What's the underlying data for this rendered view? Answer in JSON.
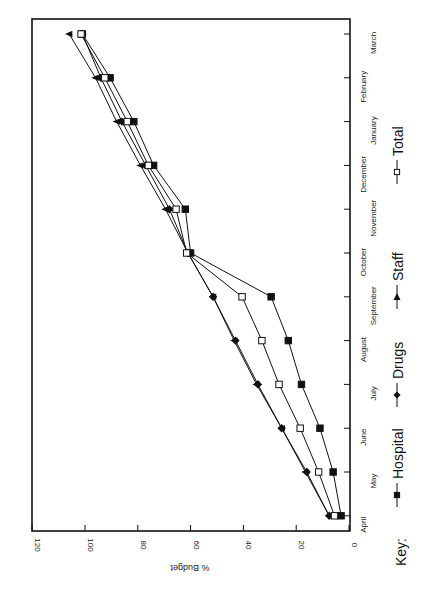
{
  "chart_data": {
    "type": "line",
    "orientation": "rotated-90-clockwise",
    "title": "",
    "xlabel": "",
    "ylabel": "% Budget",
    "ylim": [
      0,
      120
    ],
    "yticks": [
      0,
      20,
      40,
      60,
      80,
      100,
      120
    ],
    "categories": [
      "April",
      "May",
      "June",
      "July",
      "August",
      "September",
      "October",
      "November",
      "December",
      "January",
      "February",
      "March"
    ],
    "series": [
      {
        "name": "Hospital",
        "marker": "filled-square",
        "values": [
          3,
          6,
          11,
          18,
          23,
          29.5,
          60,
          62,
          74,
          81.5,
          90.5,
          101
        ]
      },
      {
        "name": "Drugs",
        "marker": "filled-diamond",
        "values": [
          7.5,
          16,
          25.5,
          34.5,
          43,
          51.5,
          61,
          68,
          77,
          86,
          94,
          101
        ]
      },
      {
        "name": "Staff",
        "marker": "filled-triangle",
        "values": [
          7.5,
          16.5,
          25.5,
          35,
          43.5,
          51.5,
          61,
          69.5,
          79,
          88,
          96,
          106
        ]
      },
      {
        "name": "Total",
        "marker": "open-square",
        "values": [
          5.5,
          11.5,
          18.5,
          26.5,
          33,
          40.5,
          61.5,
          65.5,
          76,
          84,
          92.5,
          101.5
        ]
      }
    ],
    "grid": false,
    "legend_position": "bottom (rotated: right side)"
  },
  "legend": {
    "key_label": "Key:",
    "items": [
      {
        "label": "Hospital",
        "icon": "filled-square-icon"
      },
      {
        "label": "Drugs",
        "icon": "filled-diamond-icon"
      },
      {
        "label": "Staff",
        "icon": "filled-triangle-icon"
      },
      {
        "label": "Total",
        "icon": "open-square-icon"
      }
    ]
  },
  "axis": {
    "value_title": "% Budget",
    "value_ticks": [
      "0",
      "20",
      "40",
      "60",
      "80",
      "100",
      "120"
    ],
    "month_ticks": [
      "April",
      "May",
      "June",
      "July",
      "August",
      "September",
      "October",
      "November",
      "December",
      "January",
      "February",
      "March"
    ]
  }
}
